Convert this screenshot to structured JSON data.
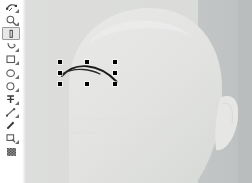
{
  "app": {
    "title": "Vector Graphics Editor",
    "canvas_background": "#c9cbcb",
    "artwork_fill": "#e3e4e2",
    "artwork_shade": "#d6d8d6",
    "stroke_color": "#1a1a1a",
    "handle_color": "#000000",
    "active_tool_highlight": "#e8e8e8"
  },
  "toolbar": {
    "name": "tool-palette",
    "orientation": "vertical",
    "active_index": 2,
    "items": [
      {
        "id": "node-edit-tool",
        "label": "Node Editor",
        "icon": "node-editor-icon",
        "active": false,
        "has_menu": true
      },
      {
        "id": "zoom-tool",
        "label": "Zoom",
        "icon": "magnifier-icon",
        "active": false,
        "has_menu": true
      },
      {
        "id": "measure-tool",
        "label": "Measure",
        "icon": "measure-ruler-icon",
        "active": true,
        "has_menu": false
      },
      {
        "id": "freehand-tool",
        "label": "Freehand",
        "icon": "freehand-curve-icon",
        "active": false,
        "has_menu": true
      },
      {
        "id": "rectangle-tool",
        "label": "Rectangle",
        "icon": "rectangle-icon",
        "active": false,
        "has_menu": true
      },
      {
        "id": "ellipse-tool",
        "label": "Ellipse",
        "icon": "ellipse-icon",
        "active": false,
        "has_menu": true
      },
      {
        "id": "circle-tool",
        "label": "Circle",
        "icon": "circle-icon",
        "active": false,
        "has_menu": true
      },
      {
        "id": "text-tool",
        "label": "Text",
        "icon": "text-tool-icon",
        "active": false,
        "has_menu": true
      },
      {
        "id": "line-tool",
        "label": "Line",
        "icon": "line-segment-icon",
        "active": false,
        "has_menu": true
      },
      {
        "id": "pen-tool",
        "label": "Pen",
        "icon": "pen-nib-icon",
        "active": false,
        "has_menu": false
      },
      {
        "id": "crop-tool",
        "label": "Crop",
        "icon": "crop-frame-icon",
        "active": false,
        "has_menu": true
      },
      {
        "id": "pattern-fill-tool",
        "label": "Pattern Fill",
        "icon": "checker-pattern-icon",
        "active": false,
        "has_menu": false
      }
    ]
  },
  "canvas": {
    "name": "drawing-canvas",
    "width": 226,
    "height": 183,
    "artwork": {
      "name": "cartoon-head",
      "description": "Large rounded head shape with an ear on the right side"
    }
  },
  "selection": {
    "name": "selected-path",
    "object_type": "curve",
    "description": "Curved stroke path (eyebrow) currently selected",
    "bbox": {
      "x": 34,
      "y": 62,
      "width": 55,
      "height": 22
    },
    "handle_count": 8,
    "handles": [
      {
        "id": "handle-nw",
        "label": "top-left",
        "x": 34,
        "y": 62
      },
      {
        "id": "handle-n",
        "label": "top-center",
        "x": 61,
        "y": 62
      },
      {
        "id": "handle-ne",
        "label": "top-right",
        "x": 89,
        "y": 62
      },
      {
        "id": "handle-w",
        "label": "middle-left",
        "x": 34,
        "y": 73
      },
      {
        "id": "handle-e",
        "label": "middle-right",
        "x": 89,
        "y": 73
      },
      {
        "id": "handle-sw",
        "label": "bottom-left",
        "x": 34,
        "y": 84
      },
      {
        "id": "handle-s",
        "label": "bottom-center",
        "x": 61,
        "y": 84
      },
      {
        "id": "handle-se",
        "label": "bottom-right",
        "x": 89,
        "y": 84
      }
    ]
  }
}
